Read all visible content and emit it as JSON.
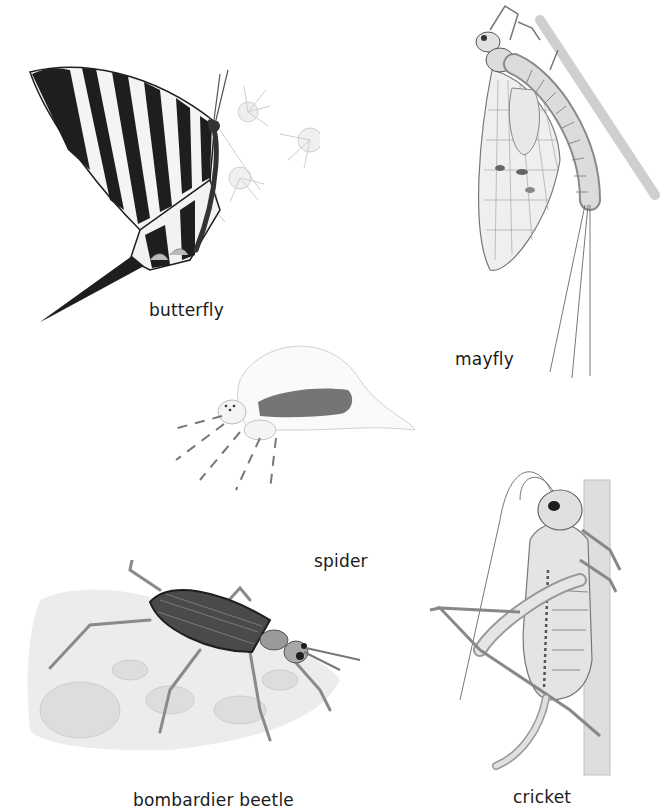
{
  "plate": {
    "background": "#ffffff",
    "specimens": [
      {
        "id": "butterfly",
        "label": "butterfly"
      },
      {
        "id": "mayfly",
        "label": "mayfly"
      },
      {
        "id": "spider",
        "label": "spider"
      },
      {
        "id": "bombardier-beetle",
        "label": "bombardier beetle"
      },
      {
        "id": "cricket",
        "label": "cricket"
      }
    ]
  },
  "colors": {
    "ink_dark": "#1e1e1e",
    "ink_mid": "#6b6b6b",
    "ink_light": "#bdbdbd",
    "wash": "#e6e6e6",
    "label_text": "#1a1a1a"
  }
}
